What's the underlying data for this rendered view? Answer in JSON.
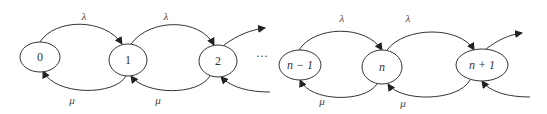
{
  "diagram": {
    "type": "birth-death state transition diagram",
    "nodes": [
      {
        "id": "0",
        "label": "0"
      },
      {
        "id": "1",
        "label": "1"
      },
      {
        "id": "2",
        "label": "2"
      },
      {
        "id": "n-1",
        "label": "n − 1"
      },
      {
        "id": "n",
        "label": "n"
      },
      {
        "id": "n+1",
        "label": "n + 1"
      }
    ],
    "ellipsis": "···",
    "edges": {
      "arrival_rate_label": "λ",
      "service_rate_label": "μ",
      "forward": [
        {
          "from": "0",
          "to": "1",
          "label": "λ"
        },
        {
          "from": "1",
          "to": "2",
          "label": "λ"
        },
        {
          "from": "2",
          "to": "…",
          "label": ""
        },
        {
          "from": "n-1",
          "to": "n",
          "label": "λ"
        },
        {
          "from": "n",
          "to": "n+1",
          "label": "λ"
        },
        {
          "from": "n+1",
          "to": "…",
          "label": ""
        }
      ],
      "backward": [
        {
          "from": "1",
          "to": "0",
          "label": "μ"
        },
        {
          "from": "2",
          "to": "1",
          "label": "μ"
        },
        {
          "from": "…",
          "to": "2",
          "label": ""
        },
        {
          "from": "n",
          "to": "n-1",
          "label": "μ"
        },
        {
          "from": "n+1",
          "to": "n",
          "label": "μ"
        },
        {
          "from": "…",
          "to": "n+1",
          "label": ""
        }
      ]
    },
    "labels": {
      "lambda_0_1": "λ",
      "lambda_1_2": "λ",
      "lambda_nm1_n": "λ",
      "lambda_n_np1": "λ",
      "mu_1_0": "μ",
      "mu_2_1": "μ",
      "mu_n_nm1": "μ",
      "mu_np1_n": "μ"
    }
  }
}
